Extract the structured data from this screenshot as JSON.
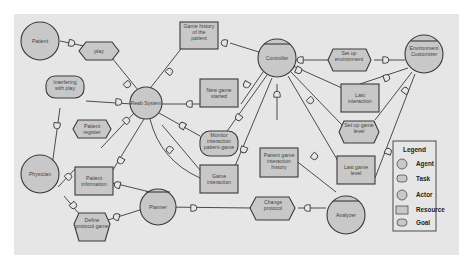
{
  "diagram": {
    "colors": {
      "background": "#e6e6e6",
      "node_fill": "#c8c8c8",
      "stroke": "#3a3a3a"
    },
    "nodes": {
      "patient": {
        "label": "Patient",
        "type": "actor"
      },
      "play": {
        "label": "play",
        "type": "task"
      },
      "interfering": {
        "label": "Interfering with play",
        "type": "goal"
      },
      "patient_register": {
        "label": "Patient register",
        "type": "task"
      },
      "physician": {
        "label": "Physician",
        "type": "actor"
      },
      "patient_information": {
        "label": "Patient information",
        "type": "resource"
      },
      "define_protocol": {
        "label": "Define protocol game",
        "type": "task"
      },
      "rehab_system": {
        "label": "Reab System",
        "type": "actor"
      },
      "game_history": {
        "label": "Game history of the patient",
        "type": "resource"
      },
      "new_game_started": {
        "label": "New game started",
        "type": "resource"
      },
      "monitor_interaction": {
        "label": "Monitor interaction patient-game",
        "type": "goal"
      },
      "game_interaction": {
        "label": "Game interaction",
        "type": "resource"
      },
      "planner": {
        "label": "Planner",
        "type": "agent"
      },
      "controller": {
        "label": "Controller",
        "type": "agent"
      },
      "patient_game_history": {
        "label": "Patient game interaction history",
        "type": "resource"
      },
      "change_protocol": {
        "label": "Change protocol",
        "type": "task"
      },
      "analyzer": {
        "label": "Analyzer",
        "type": "agent"
      },
      "set_up_environment": {
        "label": "Set up environment",
        "type": "task"
      },
      "last_interaction": {
        "label": "Last interaction",
        "type": "resource"
      },
      "set_up_game_level": {
        "label": "Set up game level",
        "type": "task"
      },
      "last_game_level": {
        "label": "Last game level",
        "type": "resource"
      },
      "environment_customizer": {
        "label": "Environment Customizer",
        "type": "agent"
      }
    },
    "legend": {
      "title": "Legend",
      "items": [
        {
          "label": "Agent",
          "shape": "agent"
        },
        {
          "label": "Task",
          "shape": "task"
        },
        {
          "label": "Actor",
          "shape": "actor"
        },
        {
          "label": "Resource",
          "shape": "resource"
        },
        {
          "label": "Goal",
          "shape": "goal"
        }
      ]
    }
  }
}
